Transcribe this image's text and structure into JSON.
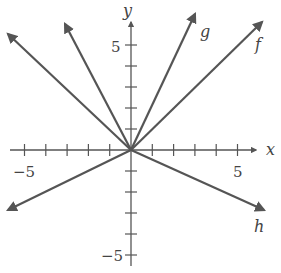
{
  "chart_data": {
    "type": "line",
    "title": "",
    "xlabel": "x",
    "ylabel": "y",
    "xlim": [
      -6,
      6.5
    ],
    "ylim": [
      -6,
      6.5
    ],
    "grid": false,
    "legend": "inline labels at line ends",
    "x_tick_labels": [
      {
        "value": -5,
        "label": "−5"
      },
      {
        "value": 5,
        "label": "5"
      }
    ],
    "y_tick_labels": [
      {
        "value": 5,
        "label": "5"
      },
      {
        "value": -5,
        "label": "−5"
      }
    ],
    "ticks_every": 1,
    "series": [
      {
        "name": "f",
        "equation": "y = x",
        "slope": 1,
        "x": [
          -6,
          6.2
        ],
        "y": [
          -6,
          6.2
        ],
        "labeled": true
      },
      {
        "name": "g",
        "equation": "y = 2x",
        "slope": 2,
        "x": [
          0,
          3.1
        ],
        "y": [
          0,
          6.2
        ],
        "labeled": true
      },
      {
        "name": "h",
        "equation": "y = -x/2",
        "slope": -0.5,
        "x": [
          -6,
          6.3
        ],
        "y": [
          3,
          -3.15
        ],
        "labeled": true
      },
      {
        "name": "",
        "equation": "y = -2x",
        "slope": -2,
        "x": [
          -3.1,
          0
        ],
        "y": [
          6.2,
          0
        ],
        "labeled": false
      },
      {
        "name": "",
        "equation": "y = -x",
        "slope": -1,
        "x": [
          -5.8,
          0
        ],
        "y": [
          5.8,
          0
        ],
        "labeled": false
      },
      {
        "name": "",
        "equation": "y = x/2",
        "slope": 0.5,
        "x": [
          -5.8,
          0
        ],
        "y": [
          -2.9,
          0
        ],
        "labeled": false
      }
    ],
    "annotations": [
      "f",
      "g",
      "h"
    ]
  },
  "axes": {
    "x_label": "x",
    "y_label": "y",
    "x_neg_label": "−5",
    "x_pos_label": "5",
    "y_pos_label": "5",
    "y_neg_label": "−5"
  },
  "line_labels": {
    "f": "f",
    "g": "g",
    "h": "h"
  },
  "colors": {
    "line": "#555555",
    "axis": "#555555",
    "text": "#444444"
  }
}
